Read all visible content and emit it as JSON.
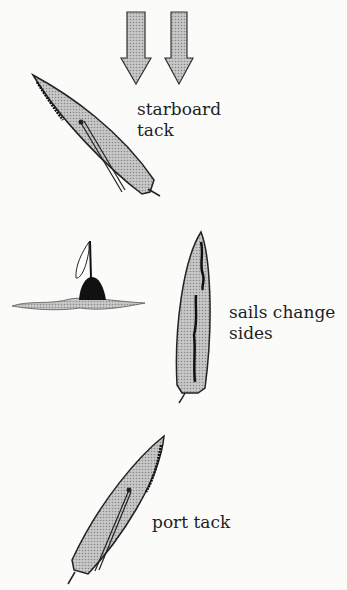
{
  "diagram": {
    "wind_arrows": {
      "count": 2,
      "direction": "down"
    },
    "boats": [
      {
        "id": "boat-starboard",
        "label_lines": [
          "starboard",
          "tack"
        ]
      },
      {
        "id": "boat-head-to-wind",
        "label_lines": [
          "sails change",
          "sides"
        ]
      },
      {
        "id": "boat-port",
        "label_lines": [
          "port tack"
        ]
      }
    ],
    "buoy": {
      "type": "flag-buoy"
    },
    "colors": {
      "hull_fill": "#b9b9b9",
      "outline": "#1e1e1e",
      "sail": "#111111",
      "background": "#fbfbf9"
    }
  }
}
